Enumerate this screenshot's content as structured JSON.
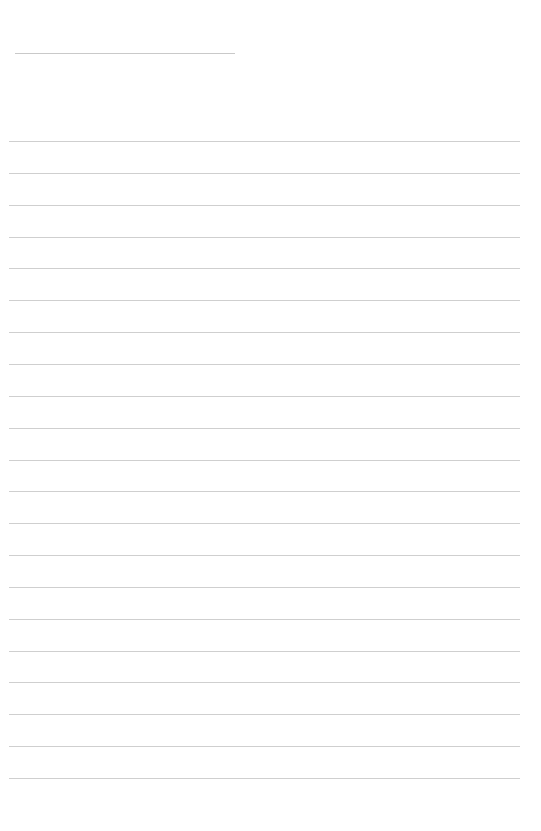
{
  "page": {
    "type": "lined-paper",
    "background": "#ffffff",
    "line_color": "#cfcfcf",
    "title_line": {
      "x": 15,
      "y": 53,
      "width": 220
    },
    "ruled_lines": {
      "count": 21,
      "first_y": 141,
      "last_y": 778,
      "x": 9,
      "width": 511
    }
  }
}
